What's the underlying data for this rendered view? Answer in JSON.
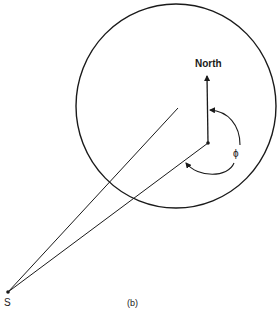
{
  "figure": {
    "caption": "(b)",
    "labels": {
      "north": "North",
      "angle": "ϕ",
      "source": "S"
    },
    "colors": {
      "stroke": "#1a1a1a",
      "background": "#ffffff"
    }
  }
}
